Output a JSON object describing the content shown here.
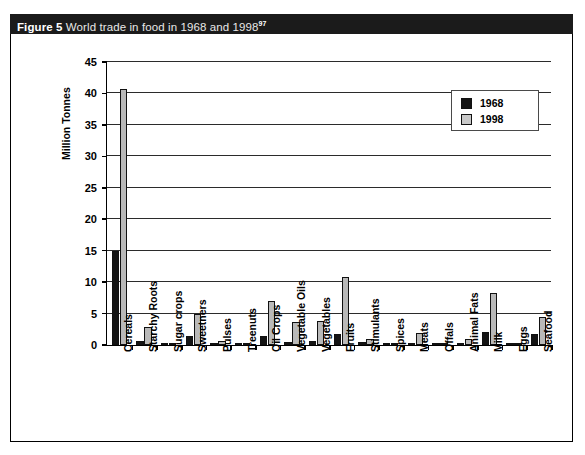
{
  "figure": {
    "label": "Figure 5",
    "caption": "World trade in food in 1968 and 1998",
    "footnote_marker": "97"
  },
  "legend": {
    "position": "top-right",
    "items": [
      {
        "label": "1968",
        "color": "#141414"
      },
      {
        "label": "1998",
        "color": "#c9c9c9"
      }
    ]
  },
  "chart_data": {
    "type": "bar",
    "title": "World trade in food in 1968 and 1998",
    "xlabel": "",
    "ylabel": "Million Tonnes",
    "ylim": [
      0,
      45
    ],
    "yticks": [
      0,
      5,
      10,
      15,
      20,
      25,
      30,
      35,
      40,
      45
    ],
    "ytick_labels": [
      "0",
      "5",
      "10",
      "15",
      "20",
      "25",
      "30",
      "35",
      "40",
      "45"
    ],
    "grid": true,
    "legend_position": "upper right",
    "categories": [
      "Cereals",
      "Starchy Roots",
      "Sugar crops",
      "Sweetners",
      "Pulses",
      "Treenuts",
      "Oil Crops",
      "Vegetable Oils",
      "Vegetables",
      "Fruits",
      "Stimulants",
      "Spices",
      "Meats",
      "Offals",
      "Animal Fats",
      "Milk",
      "Eggs",
      "Seafood"
    ],
    "series": [
      {
        "name": "1968",
        "color": "#141414",
        "values": [
          15.0,
          0.6,
          0.1,
          1.4,
          0.1,
          0.1,
          1.4,
          0.5,
          0.7,
          1.7,
          0.5,
          0.1,
          0.4,
          0.1,
          0.4,
          2.0,
          0.1,
          1.8
        ]
      },
      {
        "name": "1998",
        "color": "#b9b9b9",
        "values": [
          40.7,
          2.8,
          0.2,
          4.9,
          0.7,
          0.3,
          7.0,
          3.7,
          3.8,
          10.8,
          1.0,
          0.2,
          1.9,
          0.3,
          0.9,
          8.3,
          0.2,
          4.4
        ]
      }
    ]
  }
}
